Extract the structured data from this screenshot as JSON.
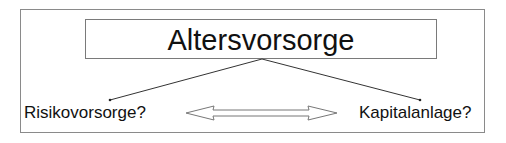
{
  "diagram": {
    "title": "Altersvorsorge",
    "left_option": "Risikovorsorge?",
    "right_option": "Kapitalanlage?",
    "connectors": [
      {
        "from": "title",
        "to": "left_option",
        "type": "line"
      },
      {
        "from": "title",
        "to": "right_option",
        "type": "line"
      },
      {
        "from": "left_option",
        "to": "right_option",
        "type": "double-arrow"
      }
    ],
    "colors": {
      "border": "#8a8a8a",
      "text": "#111111",
      "background": "#ffffff"
    }
  }
}
